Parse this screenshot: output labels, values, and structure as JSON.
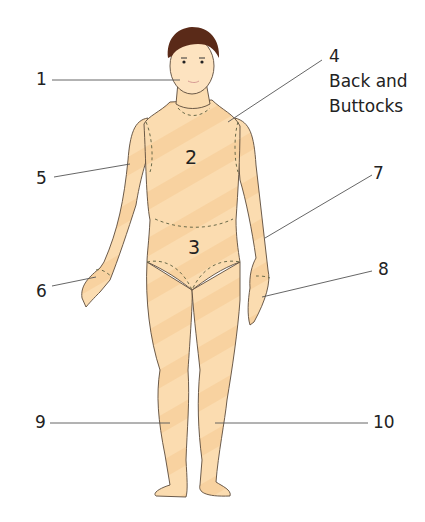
{
  "diagram": {
    "type": "body-region-map",
    "figure": "front view of male human body",
    "colors": {
      "skin": "#fbdcb0",
      "skin_stripe": "#f7c98e",
      "outline": "#5a4a3a",
      "hair": "#5a2a18",
      "region_boundary": "#6b6b4a",
      "leader_line": "#555555",
      "text": "#222222"
    },
    "body_regions": [
      {
        "id": "2",
        "label": "2",
        "region": "chest/torso"
      },
      {
        "id": "3",
        "label": "3",
        "region": "abdomen"
      }
    ],
    "callouts": [
      {
        "id": "1",
        "label": "1",
        "target": "head/face"
      },
      {
        "id": "4",
        "label": "4",
        "line2": "Back and",
        "line3": "Buttocks"
      },
      {
        "id": "5",
        "label": "5",
        "target": "right arm"
      },
      {
        "id": "6",
        "label": "6",
        "target": "right hand"
      },
      {
        "id": "7",
        "label": "7",
        "target": "left arm"
      },
      {
        "id": "8",
        "label": "8",
        "target": "left hand"
      },
      {
        "id": "9",
        "label": "9",
        "target": "right leg"
      },
      {
        "id": "10",
        "label": "10",
        "target": "left leg"
      }
    ]
  }
}
